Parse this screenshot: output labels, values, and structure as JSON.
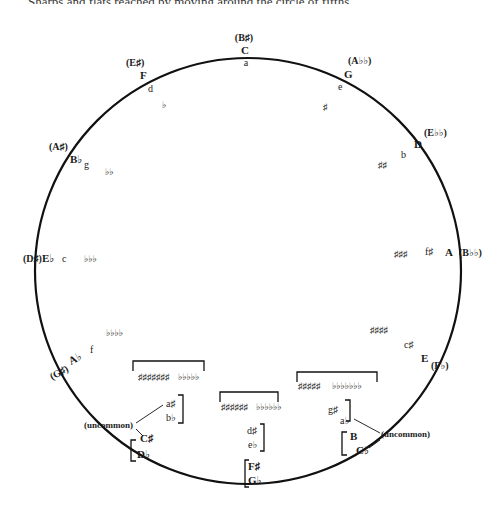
{
  "header": {
    "text": "Sharps and flats reached by moving around the circle of fifths"
  },
  "diagram": {
    "title": "Circle of Fifths",
    "positions": [
      {
        "major": "C",
        "enharmonic": "(B♯)",
        "minor": "a",
        "signature": ""
      },
      {
        "major": "G",
        "enharmonic": "(A♭♭)",
        "minor": "e",
        "signature": "♯"
      },
      {
        "major": "D",
        "enharmonic": "(E♭♭)",
        "minor": "b",
        "signature": "♯♯"
      },
      {
        "major": "A",
        "enharmonic": "(B♭♭)",
        "minor": "f♯",
        "signature": "♯♯♯"
      },
      {
        "major": "E",
        "enharmonic": "(F♭)",
        "minor": "c♯",
        "signature": "♯♯♯♯"
      },
      {
        "major": "B",
        "enharmonic": "C♭",
        "minor": "g♯ / a♭",
        "signature_sharps": "♯♯♯♯♯",
        "signature_flats": "♭♭♭♭♭♭♭"
      },
      {
        "major": "F♯",
        "enharmonic": "G♭",
        "minor": "d♯ / e♭",
        "signature_sharps": "♯♯♯♯♯♯",
        "signature_flats": "♭♭♭♭♭♭"
      },
      {
        "major": "C♯",
        "enharmonic": "D♭",
        "minor": "a♯ / b♭",
        "signature_sharps": "♯♯♯♯♯♯♯",
        "signature_flats": "♭♭♭♭♭"
      },
      {
        "major": "A♭",
        "enharmonic": "(G♯)",
        "minor": "f",
        "signature": "♭♭♭♭"
      },
      {
        "major": "E♭",
        "enharmonic": "(D♯)",
        "minor": "c",
        "signature": "♭♭♭"
      },
      {
        "major": "B♭",
        "enharmonic": "(A♯)",
        "minor": "g",
        "signature": "♭♭"
      },
      {
        "major": "F",
        "enharmonic": "(E♯)",
        "minor": "d",
        "signature": "♭"
      }
    ],
    "labels": {
      "c_enh": "(B♯)",
      "c_maj": "C",
      "c_min": "a",
      "g_enh": "(A♭♭)",
      "g_maj": "G",
      "g_min": "e",
      "g_sig": "♯",
      "d_enh": "(E♭♭)",
      "d_maj": "D",
      "d_min": "b",
      "d_sig": "♯♯",
      "a_enh": "(B♭♭)",
      "a_maj": "A",
      "a_min": "f♯",
      "a_sig": "♯♯♯",
      "e_enh": "(F♭)",
      "e_maj": "E",
      "e_min": "c♯",
      "e_sig": "♯♯♯♯",
      "b_maj": "B",
      "b_enh": "C♭",
      "b_min1": "g♯",
      "b_min2": "a♭",
      "b_sig_sharp": "♯♯♯♯♯",
      "b_sig_flat": "♭♭♭♭♭♭♭",
      "fs_maj": "F♯",
      "fs_enh": "G♭",
      "fs_min1": "d♯",
      "fs_min2": "e♭",
      "fs_sig_sharp": "♯♯♯♯♯♯",
      "fs_sig_flat": "♭♭♭♭♭♭",
      "cs_maj": "C♯",
      "cs_enh": "D♭",
      "cs_min1": "a♯",
      "cs_min2": "b♭",
      "cs_sig_sharp": "♯♯♯♯♯♯♯",
      "cs_sig_flat": "♭♭♭♭♭",
      "ab_enh": "(G♯)",
      "ab_maj": "A♭",
      "ab_min": "f",
      "ab_sig": "♭♭♭♭",
      "eb_enh": "(D♯)",
      "eb_maj": "E♭",
      "eb_min": "c",
      "eb_sig": "♭♭♭",
      "bb_enh": "(A♯)",
      "bb_maj": "B♭",
      "bb_min": "g",
      "bb_sig": "♭♭",
      "f_enh": "(E♯)",
      "f_maj": "F",
      "f_min": "d",
      "f_sig": "♭",
      "uncommon_right": "(uncommon)",
      "uncommon_left": "(uncommon)"
    }
  }
}
